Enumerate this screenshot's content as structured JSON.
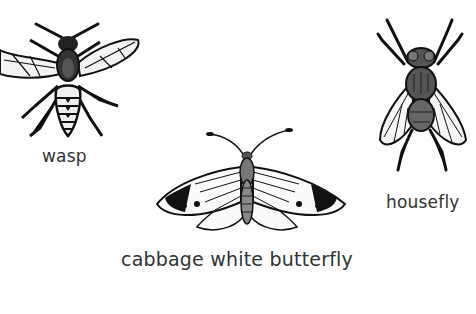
{
  "insects": [
    {
      "id": "wasp",
      "label": "wasp"
    },
    {
      "id": "housefly",
      "label": "housefly"
    },
    {
      "id": "butterfly",
      "label": "cabbage white butterfly"
    }
  ],
  "colors": {
    "ink": "#1a1a1a",
    "label": "#333333",
    "shadow": "#d9d9d9"
  }
}
